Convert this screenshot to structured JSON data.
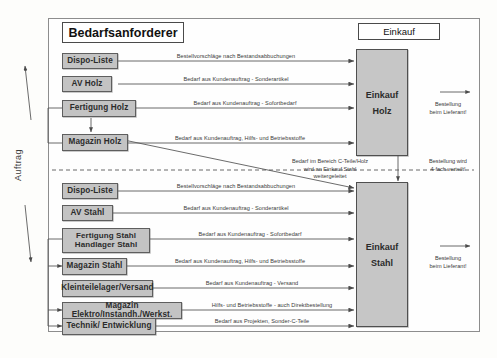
{
  "frame": {
    "outer_border_color": "#8d8d8d"
  },
  "headers": {
    "left_title": "Bedarfsanforderer",
    "right_title": "Einkauf"
  },
  "side_label": {
    "text": "Auftrag"
  },
  "wood_section": {
    "nodes": [
      {
        "id": "dispo-liste-holz",
        "label": "Dispo-Liste"
      },
      {
        "id": "av-holz",
        "label": "AV Holz"
      },
      {
        "id": "fertigung-holz",
        "label": "Fertigung Holz"
      },
      {
        "id": "magazin-holz",
        "label": "Magazin Holz"
      }
    ],
    "edge_labels": [
      "Bestellvorschläge nach Bestandsabbuchungen",
      "Bedarf aus Kundenauftrag - Sonderartikel",
      "Bedarf aus Kundenauftrag - Sofortbedarf",
      "Bedarf aus Kundenauftrag, Hilfs- und Betriebsstoffe"
    ],
    "target": {
      "line1": "Einkauf",
      "line2": "Holz"
    },
    "output_label": {
      "line1": "Bestellung",
      "line2": "beim Lieferant!"
    }
  },
  "divider_note": {
    "line1": "Bedarf im Bereich C-Teile/Holz",
    "line2": "wird an Einkauf Stahl",
    "line3": "weitergeleitet",
    "distribution_line1": "Bestellung wird",
    "distribution_line2": "4-fach verteilt!"
  },
  "steel_section": {
    "nodes": [
      {
        "id": "dispo-liste-stahl",
        "label": "Dispo-Liste"
      },
      {
        "id": "av-stahl",
        "label": "AV Stahl"
      },
      {
        "id": "fertigung-stahl",
        "label_line1": "Fertigung Stahl",
        "label_line2": "Handlager Stahl"
      },
      {
        "id": "magazin-stahl",
        "label": "Magazin Stahl"
      },
      {
        "id": "kleinteilelager",
        "label": "Kleinteilelager/Versand"
      },
      {
        "id": "magazin-elektro",
        "label": "Magazin Elektro/Instandh./Werkst."
      },
      {
        "id": "technik",
        "label": "Technik/ Entwicklung"
      }
    ],
    "edge_labels": [
      "Bestellvorschläge nach Bestandsabbuchungen",
      "Bedarf aus Kundenauftrag - Sonderartikel",
      "Bedarf aus Kundenauftrag - Sofortbedarf",
      "Bedarf aus Kundenauftrag, Hilfs- und Betriebsstoffe",
      "Bedarf aus Kundenauftrag - Versand",
      "Hilfs- und Betriebsstoffe - auch Direktbestellung",
      "Bedarf aus Projekten, Sonder-C-Teile"
    ],
    "target": {
      "line1": "Einkauf",
      "line2": "Stahl"
    },
    "output_label": {
      "line1": "Bestellung",
      "line2": "beim Lieferant!"
    }
  }
}
